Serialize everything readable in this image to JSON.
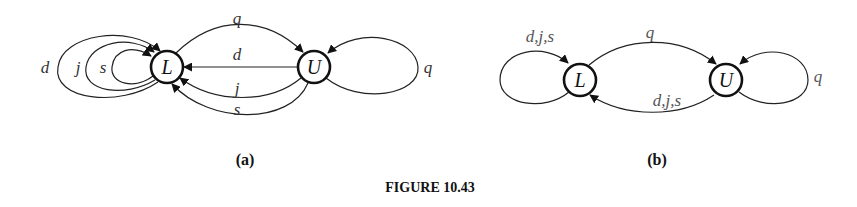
{
  "figure": {
    "caption": "FIGURE 10.43",
    "panels": [
      {
        "id": "a",
        "label": "(a)",
        "nodes": [
          {
            "id": "L",
            "label": "L"
          },
          {
            "id": "U",
            "label": "U"
          }
        ],
        "edges": [
          {
            "from": "L",
            "to": "L",
            "label": "d"
          },
          {
            "from": "L",
            "to": "L",
            "label": "j"
          },
          {
            "from": "L",
            "to": "L",
            "label": "s"
          },
          {
            "from": "L",
            "to": "U",
            "label": "q"
          },
          {
            "from": "U",
            "to": "L",
            "label": "d"
          },
          {
            "from": "U",
            "to": "L",
            "label": "j"
          },
          {
            "from": "U",
            "to": "L",
            "label": "s"
          },
          {
            "from": "U",
            "to": "U",
            "label": "q"
          }
        ]
      },
      {
        "id": "b",
        "label": "(b)",
        "nodes": [
          {
            "id": "L",
            "label": "L"
          },
          {
            "id": "U",
            "label": "U"
          }
        ],
        "edges": [
          {
            "from": "L",
            "to": "L",
            "label": "d,j,s"
          },
          {
            "from": "L",
            "to": "U",
            "label": "q"
          },
          {
            "from": "U",
            "to": "L",
            "label": "d,j,s"
          },
          {
            "from": "U",
            "to": "U",
            "label": "q"
          }
        ]
      }
    ]
  }
}
